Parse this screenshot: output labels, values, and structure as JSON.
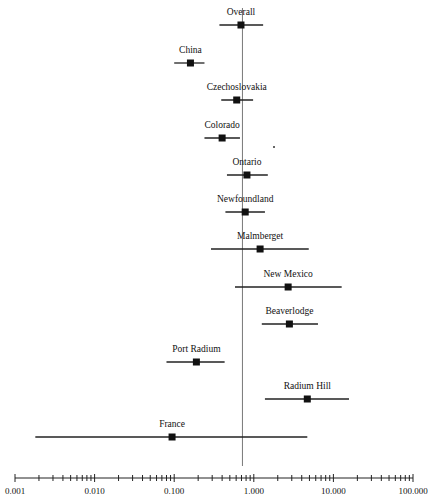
{
  "chart_data": {
    "type": "forest",
    "title": "",
    "xlabel": "",
    "ylabel": "",
    "x_scale": "log",
    "xlim": [
      0.001,
      100
    ],
    "x_ticks": [
      "0.001",
      "0.010",
      "0.100",
      "1.000",
      "10.000",
      "100.000"
    ],
    "reference_line": 0.72,
    "grid": false,
    "legend": null,
    "series": [
      {
        "name": "Overall",
        "estimate": 0.69,
        "lower": 0.37,
        "upper": 1.31
      },
      {
        "name": "China",
        "estimate": 0.16,
        "lower": 0.1,
        "upper": 0.24
      },
      {
        "name": "Czechoslovakia",
        "estimate": 0.61,
        "lower": 0.39,
        "upper": 0.98
      },
      {
        "name": "Colorado",
        "estimate": 0.4,
        "lower": 0.24,
        "upper": 0.67
      },
      {
        "name": "Ontario",
        "estimate": 0.82,
        "lower": 0.46,
        "upper": 1.5
      },
      {
        "name": "Newfoundland",
        "estimate": 0.78,
        "lower": 0.44,
        "upper": 1.38
      },
      {
        "name": "Malmberget",
        "estimate": 1.2,
        "lower": 0.29,
        "upper": 4.9
      },
      {
        "name": "New Mexico",
        "estimate": 2.7,
        "lower": 0.58,
        "upper": 12.7
      },
      {
        "name": "Beaverlodge",
        "estimate": 2.8,
        "lower": 1.26,
        "upper": 6.4
      },
      {
        "name": "Port Radium",
        "estimate": 0.19,
        "lower": 0.08,
        "upper": 0.43
      },
      {
        "name": "Radium Hill",
        "estimate": 4.7,
        "lower": 1.38,
        "upper": 15.7
      },
      {
        "name": "France",
        "estimate": 0.094,
        "lower": 0.0018,
        "upper": 4.7
      }
    ]
  }
}
